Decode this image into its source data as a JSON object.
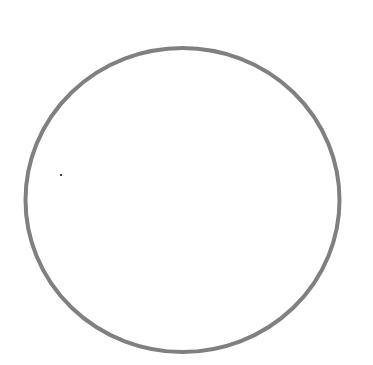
{
  "canvas": {
    "width": 373,
    "height": 365,
    "background": "#ffffff"
  },
  "shapes": [
    {
      "type": "ellipse",
      "cx": 182.5,
      "cy": 200,
      "rx": 157,
      "ry": 152,
      "stroke": "#808080",
      "stroke_width": 4,
      "fill": "none"
    },
    {
      "type": "dot",
      "cx": 61,
      "cy": 175,
      "r": 1,
      "fill": "#000000"
    }
  ]
}
